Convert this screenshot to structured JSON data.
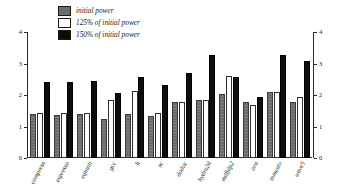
{
  "chart_data": {
    "type": "bar",
    "title": "",
    "xlabel": "",
    "ylabel": "",
    "ylim": [
      0,
      4
    ],
    "y_ticks": [
      "0",
      "1",
      "2",
      "3",
      "4"
    ],
    "y_ticks_right": [
      "0",
      "1",
      "2",
      "3",
      "4"
    ],
    "grid": false,
    "legend_position": "top-left",
    "categories": [
      "compress",
      "espresso",
      "eqntott",
      "gcc",
      "li",
      "sc",
      "doduc",
      "hydro2d",
      "mdljdp2",
      "ora",
      "tomcatv",
      "wave5"
    ],
    "series": [
      {
        "name": "initial power",
        "color": "#6b6b6b",
        "values": [
          1.4,
          1.37,
          1.4,
          1.23,
          1.4,
          1.32,
          1.78,
          1.83,
          2.03,
          1.78,
          2.08,
          1.78
        ]
      },
      {
        "name": "125% of initial power",
        "color": "#ffffff",
        "values": [
          1.42,
          1.42,
          1.42,
          1.83,
          2.12,
          1.42,
          1.78,
          1.85,
          2.6,
          1.68,
          2.1,
          1.95
        ]
      },
      {
        "name": "150% of initial power",
        "color": "#0d0d0d",
        "values": [
          2.42,
          2.4,
          2.45,
          2.05,
          2.57,
          2.32,
          2.7,
          3.28,
          2.58,
          1.93,
          3.28,
          3.07
        ]
      }
    ]
  },
  "legend": {
    "items": [
      {
        "label": "initial power",
        "swatch": "sw-initial"
      },
      {
        "label": "125% of initial power",
        "swatch": "sw-125"
      },
      {
        "label": "150% of initial power",
        "swatch": "sw-150"
      }
    ]
  }
}
